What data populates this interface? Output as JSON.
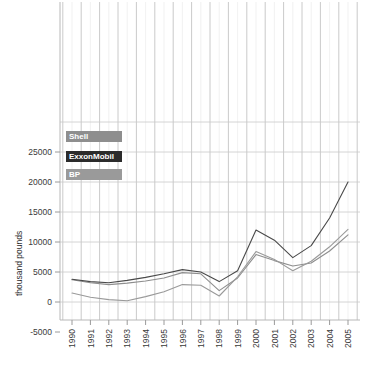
{
  "chart_data": {
    "type": "line",
    "title": "",
    "subtitle": "",
    "xlabel": "",
    "ylabel": "thousand pounds",
    "x": [
      1990,
      1991,
      1992,
      1993,
      1994,
      1995,
      1996,
      1997,
      1998,
      1999,
      2000,
      2001,
      2002,
      2003,
      2004,
      2005
    ],
    "xtick_labels": [
      "1990",
      "1991",
      "1992",
      "1993",
      "1994",
      "1995",
      "1996",
      "1997",
      "1998",
      "1999",
      "2000",
      "2001",
      "2002",
      "2003",
      "2004",
      "2005"
    ],
    "ytick_labels": [
      "25000",
      "20000",
      "15000",
      "10000",
      "5000",
      "0",
      "-5000"
    ],
    "ytick_values": [
      25000,
      20000,
      15000,
      10000,
      5000,
      0,
      -5000
    ],
    "ylim": [
      -5000,
      31000
    ],
    "xlim": [
      1989.5,
      2005.8
    ],
    "grid": "both",
    "legend_position": "upper-left-inside",
    "series": [
      {
        "name": "Shell",
        "color": "#8e8e8e",
        "values": [
          3700,
          3200,
          2900,
          3150,
          3500,
          4000,
          4900,
          4700,
          1900,
          4000,
          7900,
          6900,
          6000,
          6500,
          8500,
          11200
        ]
      },
      {
        "name": "ExxonMobil",
        "color": "#4a4a4a",
        "values": [
          3800,
          3400,
          3200,
          3600,
          4100,
          4700,
          5400,
          5000,
          3400,
          5200,
          12000,
          10300,
          7400,
          9400,
          14000,
          20000
        ]
      },
      {
        "name": "BP",
        "color": "#9a9a9a",
        "values": [
          1500,
          800,
          400,
          200,
          900,
          1700,
          2900,
          2800,
          1000,
          4200,
          8400,
          7100,
          5200,
          6800,
          9200,
          12100
        ]
      }
    ]
  },
  "legend": {
    "items": [
      {
        "label": "Shell",
        "swatch_color": "#8e8e8e",
        "text_color": "#ffffff"
      },
      {
        "label": "ExxonMobil",
        "swatch_color": "#2b2b2b",
        "text_color": "#ffffff"
      },
      {
        "label": "BP",
        "swatch_color": "#9a9a9a",
        "text_color": "#ffffff"
      }
    ]
  },
  "axes": {
    "y_axis_title": "thousand pounds"
  }
}
